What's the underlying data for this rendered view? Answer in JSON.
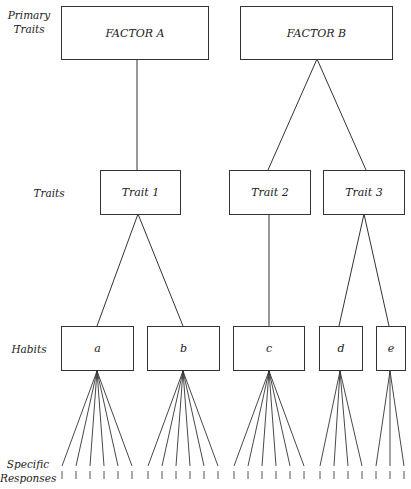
{
  "levels": {
    "primary": "Primary\nTraits",
    "primary_line1": "Primary",
    "primary_line2": "Traits",
    "traits": "Traits",
    "habits": "Habits",
    "responses_line1": "Specific",
    "responses_line2": "Responses"
  },
  "factors": [
    {
      "id": "A",
      "label": "FACTOR A",
      "children": [
        "Trait 1"
      ]
    },
    {
      "id": "B",
      "label": "FACTOR B",
      "children": [
        "Trait 2",
        "Trait 3"
      ]
    }
  ],
  "traits": [
    {
      "label": "Trait 1",
      "children": [
        "a",
        "b"
      ]
    },
    {
      "label": "Trait 2",
      "children": [
        "c"
      ]
    },
    {
      "label": "Trait 3",
      "children": [
        "d",
        "e"
      ]
    }
  ],
  "habits": [
    {
      "label": "a",
      "responses": 6
    },
    {
      "label": "b",
      "responses": 6
    },
    {
      "label": "c",
      "responses": 6
    },
    {
      "label": "d",
      "responses": 4
    },
    {
      "label": "e",
      "responses": 3
    }
  ],
  "colors": {
    "line": "#333333",
    "background": "#ffffff"
  }
}
